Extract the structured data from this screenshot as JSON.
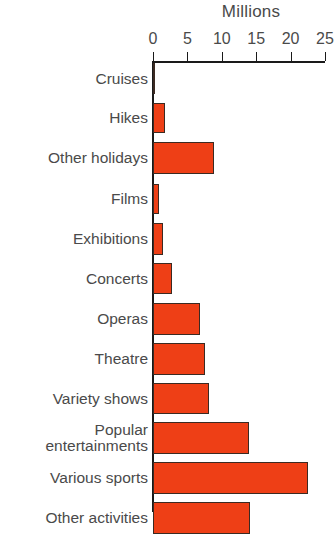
{
  "chart_data": {
    "type": "bar",
    "orientation": "horizontal",
    "title": "Millions",
    "xlabel": "",
    "ylabel": "",
    "xlim": [
      0,
      25
    ],
    "xticks": [
      0,
      5,
      10,
      15,
      20,
      25
    ],
    "xtick_labels": [
      "0",
      "5",
      "10",
      "15",
      "20",
      "25"
    ],
    "grid": false,
    "legend": false,
    "bar_color": "#ee3f16",
    "bar_edge_color": "#3b2a22",
    "axis_color": "#1a1a1a",
    "text_color": "#4a4a4a",
    "categories": [
      "Cruises",
      "Hikes",
      "Other holidays",
      "Films",
      "Exhibitions",
      "Concerts",
      "Operas",
      "Theatre",
      "Variety shows",
      "Popular entertainments",
      "Various sports",
      "Other activities"
    ],
    "values": [
      0.2,
      1.8,
      8.8,
      0.9,
      1.5,
      2.8,
      6.8,
      7.6,
      8.2,
      14.0,
      22.6,
      14.1
    ]
  },
  "bars": [
    {
      "label": "Cruises",
      "label_line1": "Cruises",
      "label_line2": "",
      "value": 0.2,
      "top": 0,
      "height": 31
    },
    {
      "label": "Hikes",
      "label_line1": "Hikes",
      "label_line2": "",
      "value": 1.8,
      "top": 40,
      "height": 30
    },
    {
      "label": "Other holidays",
      "label_line1": "Other holidays",
      "label_line2": "",
      "value": 8.8,
      "top": 79,
      "height": 32
    },
    {
      "label": "Films",
      "label_line1": "Films",
      "label_line2": "",
      "value": 0.9,
      "top": 121,
      "height": 30
    },
    {
      "label": "Exhibitions",
      "label_line1": "Exhibitions",
      "label_line2": "",
      "value": 1.5,
      "top": 160,
      "height": 32
    },
    {
      "label": "Concerts",
      "label_line1": "Concerts",
      "label_line2": "",
      "value": 2.8,
      "top": 200,
      "height": 31
    },
    {
      "label": "Operas",
      "label_line1": "Operas",
      "label_line2": "",
      "value": 6.8,
      "top": 240,
      "height": 32
    },
    {
      "label": "Theatre",
      "label_line1": "Theatre",
      "label_line2": "",
      "value": 7.6,
      "top": 280,
      "height": 32
    },
    {
      "label": "Variety shows",
      "label_line1": "Variety shows",
      "label_line2": "",
      "value": 8.2,
      "top": 320,
      "height": 31
    },
    {
      "label": "Popular entertainments",
      "label_line1": "Popular",
      "label_line2": "entertainments",
      "value": 14.0,
      "top": 359,
      "height": 32
    },
    {
      "label": "Various sports",
      "label_line1": "Various sports",
      "label_line2": "",
      "value": 22.6,
      "top": 399,
      "height": 32
    },
    {
      "label": "Other activities",
      "label_line1": "Other activities",
      "label_line2": "",
      "value": 14.1,
      "top": 439,
      "height": 32
    }
  ]
}
